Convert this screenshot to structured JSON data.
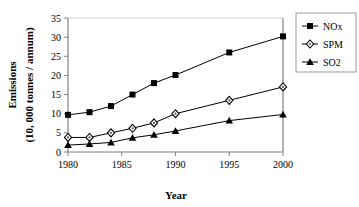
{
  "chart_data": {
    "type": "line",
    "title": "",
    "xlabel": "Year",
    "ylabel": "Emissions\n(10, 000 tonnes / annum)",
    "ylabel_line1": "Emissions",
    "ylabel_line2": "(10, 000 tonnes / annum)",
    "x": [
      1980,
      1982,
      1984,
      1986,
      1988,
      1990,
      1995,
      2000
    ],
    "xlim": [
      1980,
      2000
    ],
    "ylim": [
      0,
      35
    ],
    "xticks": [
      1980,
      1985,
      1990,
      1995,
      2000
    ],
    "xtick_labels": [
      "1980",
      "1985",
      "1990",
      "1995",
      "2000"
    ],
    "yticks": [
      0,
      5,
      10,
      15,
      20,
      25,
      30,
      35
    ],
    "ytick_labels": [
      "0",
      "5",
      "10",
      "15",
      "20",
      "25",
      "30",
      "35"
    ],
    "grid": false,
    "legend_position": "right",
    "series": [
      {
        "name": "NOx",
        "marker": "filled-square",
        "color": "#000000",
        "values": [
          9.7,
          10.4,
          12.0,
          15.0,
          18.0,
          20.1,
          26.0,
          30.2
        ]
      },
      {
        "name": "SPM",
        "marker": "open-diamond",
        "color": "#000000",
        "values": [
          3.8,
          3.8,
          5.0,
          6.2,
          7.6,
          10.0,
          13.5,
          17.0
        ]
      },
      {
        "name": "SO2",
        "marker": "filled-triangle",
        "color": "#000000",
        "values": [
          1.8,
          2.1,
          2.5,
          3.7,
          4.5,
          5.5,
          8.2,
          9.8
        ]
      }
    ]
  },
  "legend": {
    "entries": [
      {
        "label": "NOx"
      },
      {
        "label": "SPM"
      },
      {
        "label": "SO2"
      }
    ]
  },
  "axes": {
    "x_title": "Year",
    "y_title_line1": "Emissions",
    "y_title_line2": "(10, 000 tonnes / annum)"
  },
  "colors": {
    "line": "#000000",
    "frame": "#808080",
    "background": "#ffffff",
    "text": "#000000"
  }
}
